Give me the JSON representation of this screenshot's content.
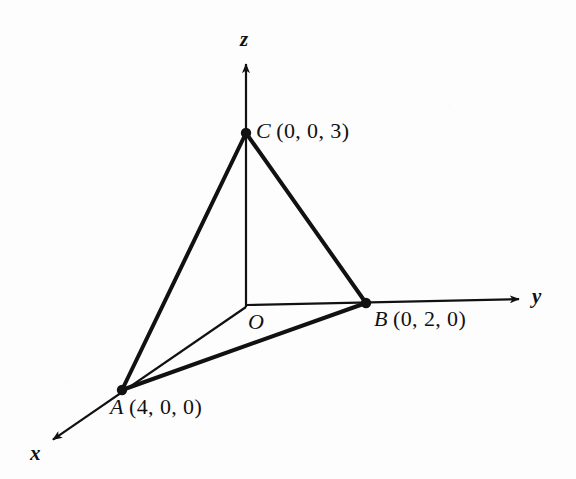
{
  "figure": {
    "background_color": "#fdfdfd",
    "ink_color": "#111111",
    "width": 576,
    "height": 479
  },
  "axes": [
    {
      "id": "z",
      "label": "z",
      "origin": [
        246,
        307
      ],
      "tip": [
        246,
        58
      ],
      "stroke_width": 2
    },
    {
      "id": "y",
      "label": "y",
      "origin": [
        246,
        305
      ],
      "tip": [
        525,
        299
      ],
      "stroke_width": 2
    },
    {
      "id": "x",
      "label": "x",
      "origin": [
        246,
        307
      ],
      "tip": [
        48,
        443
      ],
      "stroke_width": 2
    }
  ],
  "origin": {
    "label": "O",
    "position": [
      246,
      307
    ]
  },
  "points": [
    {
      "name": "C",
      "coords_text": "(0, 0, 3)",
      "coords": [
        0,
        0,
        3
      ],
      "pixel": [
        246,
        133
      ],
      "on_axis": "z"
    },
    {
      "name": "B",
      "coords_text": "(0, 2, 0)",
      "coords": [
        0,
        2,
        0
      ],
      "pixel": [
        366,
        303
      ],
      "on_axis": "y"
    },
    {
      "name": "A",
      "coords_text": "(4, 0, 0)",
      "coords": [
        4,
        0,
        0
      ],
      "pixel": [
        122,
        390
      ],
      "on_axis": "x"
    }
  ],
  "edges": [
    {
      "id": "CA",
      "from": "C",
      "to": "A",
      "style": "thick",
      "stroke_width": 4
    },
    {
      "id": "CB",
      "from": "C",
      "to": "B",
      "style": "thick",
      "stroke_width": 4
    },
    {
      "id": "AB",
      "from": "A",
      "to": "B",
      "style": "thick",
      "stroke_width": 4
    }
  ],
  "chart_data": {
    "type": "scatter",
    "xlabel": "x",
    "ylabel": "y",
    "zlabel": "z",
    "projection": "oblique-3d",
    "grid": false,
    "legend": false,
    "points": [
      {
        "label": "A",
        "x": 4,
        "y": 0,
        "z": 0,
        "annotation": "A (4, 0, 0)"
      },
      {
        "label": "B",
        "x": 0,
        "y": 2,
        "z": 0,
        "annotation": "B (0, 2, 0)"
      },
      {
        "label": "C",
        "x": 0,
        "y": 0,
        "z": 3,
        "annotation": "C (0, 0, 3)"
      },
      {
        "label": "O",
        "x": 0,
        "y": 0,
        "z": 0,
        "annotation": "O"
      }
    ],
    "segments": [
      {
        "from": "C",
        "to": "A",
        "weight": "thick"
      },
      {
        "from": "C",
        "to": "B",
        "weight": "thick"
      },
      {
        "from": "A",
        "to": "B",
        "weight": "thick"
      },
      {
        "from": "O",
        "to": "A",
        "weight": "thin"
      },
      {
        "from": "O",
        "to": "B",
        "weight": "thin"
      },
      {
        "from": "O",
        "to": "C",
        "weight": "thin"
      }
    ],
    "axis_labels": [
      "x",
      "y",
      "z"
    ],
    "annotations": [
      "C (0, 0, 3)",
      "B (0, 2, 0)",
      "A (4, 0, 0)",
      "O",
      "x",
      "y",
      "z"
    ]
  }
}
